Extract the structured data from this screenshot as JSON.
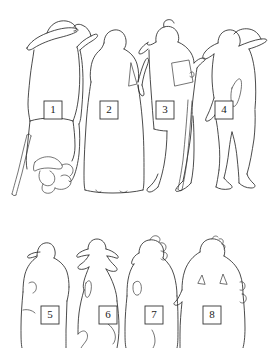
{
  "diagram": {
    "type": "figure-key-silhouette-outlines",
    "background_color": "#ffffff",
    "stroke_color": "#2b2b2b",
    "label_box_fill": "#ffffff",
    "label_box_stroke": "#333333",
    "canvas": {
      "width": 275,
      "height": 348
    },
    "rows": [
      {
        "name": "upper-row",
        "figure_count": 4,
        "labels": [
          "1",
          "2",
          "3",
          "4"
        ]
      },
      {
        "name": "lower-row",
        "figure_count": 4,
        "labels": [
          "5",
          "6",
          "7",
          "8"
        ]
      }
    ]
  },
  "figures": [
    {
      "id": "figure-1",
      "label": "1",
      "row": "upper-row",
      "description": "standing figure wearing wide-brimmed hat, holding a cane, with a dog at the feet",
      "label_box": {
        "x": 44,
        "y": 101,
        "w": 18,
        "h": 18
      }
    },
    {
      "id": "figure-2",
      "label": "2",
      "row": "upper-row",
      "description": "standing figure in a long full-length gown",
      "label_box": {
        "x": 100,
        "y": 101,
        "w": 18,
        "h": 18
      }
    },
    {
      "id": "figure-3",
      "label": "3",
      "row": "upper-row",
      "description": "standing figure in profile holding a flat rectangular object",
      "label_box": {
        "x": 156,
        "y": 101,
        "w": 18,
        "h": 18
      }
    },
    {
      "id": "figure-4",
      "label": "4",
      "row": "upper-row",
      "description": "standing figure in broad hat with arm akimbo at the hip",
      "label_box": {
        "x": 215,
        "y": 101,
        "w": 18,
        "h": 18
      }
    },
    {
      "id": "figure-5",
      "label": "5",
      "row": "lower-row",
      "description": "half-length figure wearing a cap, arms at sides",
      "label_box": {
        "x": 41,
        "y": 306,
        "w": 18,
        "h": 18
      }
    },
    {
      "id": "figure-6",
      "label": "6",
      "row": "lower-row",
      "description": "half-length figure in a pointed hat with a cape",
      "label_box": {
        "x": 99,
        "y": 306,
        "w": 18,
        "h": 18
      }
    },
    {
      "id": "figure-7",
      "label": "7",
      "row": "lower-row",
      "description": "half-length figure with curled hair, arm bent at the waist",
      "label_box": {
        "x": 145,
        "y": 306,
        "w": 18,
        "h": 18
      }
    },
    {
      "id": "figure-8",
      "label": "8",
      "row": "lower-row",
      "description": "half-length broad-shouldered figure facing forward",
      "label_box": {
        "x": 203,
        "y": 306,
        "w": 18,
        "h": 18
      }
    }
  ]
}
